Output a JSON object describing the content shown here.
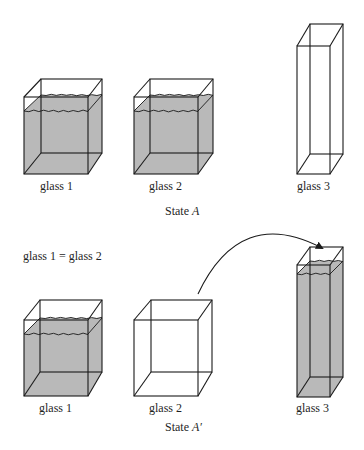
{
  "states": [
    {
      "id": "A",
      "caption_prefix": "State",
      "caption_symbol": "A",
      "caption_pos": [
        165,
        204
      ],
      "glasses": [
        {
          "label": "glass 1",
          "label_pos": [
            40,
            179
          ],
          "front": [
            24,
            97,
            88,
            174
          ],
          "back": [
            41,
            79,
            102,
            153
          ],
          "water": {
            "front_y": 111,
            "back_y": 95
          }
        },
        {
          "label": "glass 2",
          "label_pos": [
            149,
            179
          ],
          "front": [
            134,
            97,
            198,
            174
          ],
          "back": [
            150,
            79,
            213,
            153
          ],
          "water": {
            "front_y": 111,
            "back_y": 95
          }
        },
        {
          "label": "glass 3",
          "label_pos": [
            297,
            179
          ],
          "front": [
            297,
            46,
            330,
            174
          ],
          "back": [
            310,
            24,
            343,
            154
          ],
          "water": null
        }
      ]
    },
    {
      "id": "A'",
      "caption_prefix": "State",
      "caption_symbol": "A′",
      "caption_pos": [
        165,
        420
      ],
      "note": "glass 1 = glass 2",
      "note_pos": [
        23,
        249
      ],
      "glasses": [
        {
          "label": "glass 1",
          "label_pos": [
            39,
            401
          ],
          "front": [
            24,
            320,
            88,
            396
          ],
          "back": [
            40,
            300,
            102,
            372
          ],
          "water": {
            "front_y": 334,
            "back_y": 318
          }
        },
        {
          "label": "glass 2",
          "label_pos": [
            149,
            401
          ],
          "front": [
            134,
            320,
            198,
            396
          ],
          "back": [
            151,
            300,
            212,
            372
          ],
          "water": null
        },
        {
          "label": "glass 3",
          "label_pos": [
            296,
            401
          ],
          "front": [
            297,
            265,
            330,
            397
          ],
          "back": [
            310,
            247,
            343,
            377
          ],
          "water": {
            "front_y": 274,
            "back_y": 261
          }
        }
      ]
    }
  ],
  "arrow": {
    "from": [
      198,
      294
    ],
    "control": [
      240,
      205
    ],
    "to": [
      322,
      248
    ],
    "meaning": "pour glass 2 into glass 3"
  },
  "colors": {
    "line": "#1a1a1a",
    "water": "#b9b9b9",
    "text": "#1f1f1f",
    "background": "#ffffff"
  }
}
